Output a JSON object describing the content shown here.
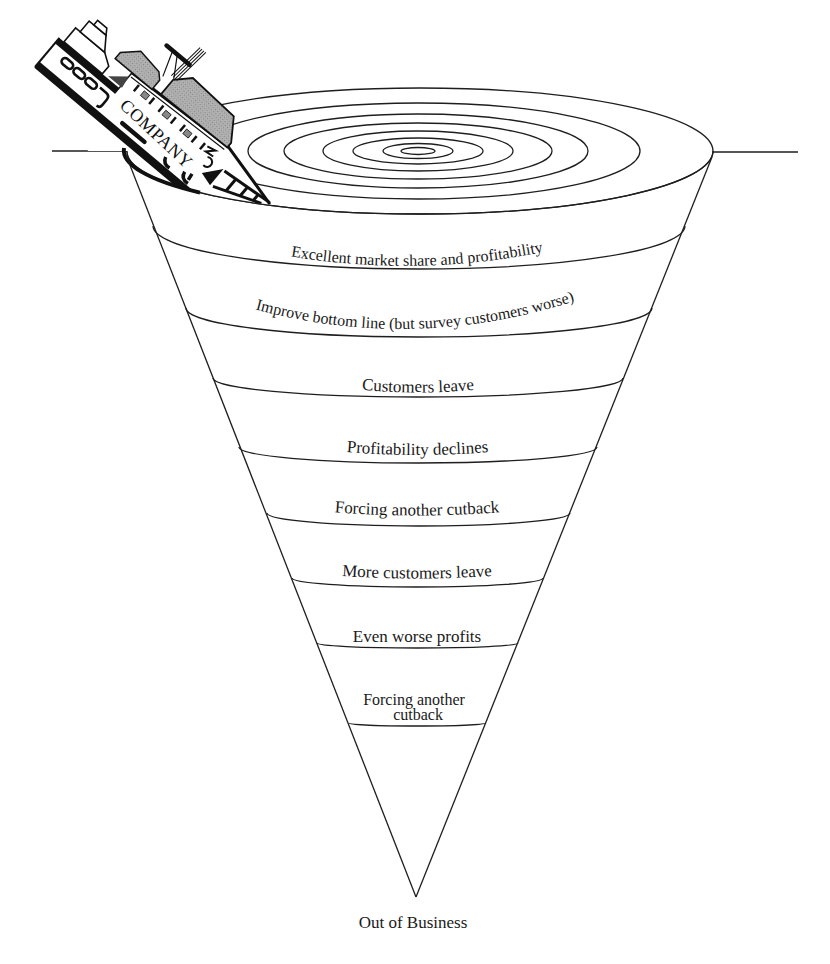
{
  "diagram": {
    "ship": {
      "label": "COMPANY",
      "icon": "sinking-ship-icon"
    },
    "whirlpool": {
      "icon": "whirlpool-ripples",
      "ring_count": 8
    },
    "stages": [
      {
        "label": "Excellent market share and profitability"
      },
      {
        "label": "Improve bottom line (but survey customers worse)"
      },
      {
        "label": "Customers leave"
      },
      {
        "label": "Profitability declines"
      },
      {
        "label": "Forcing another cutback"
      },
      {
        "label": "More customers leave"
      },
      {
        "label": "Even worse profits"
      },
      {
        "label": "Forcing another cutback",
        "lines": [
          "Forcing another",
          "cutback"
        ]
      }
    ],
    "end_label": "Out of Business"
  },
  "colors": {
    "background": "#ffffff",
    "line": "#1e1e1e",
    "ship_black": "#111111",
    "ship_gray": "#b3b3b3"
  }
}
